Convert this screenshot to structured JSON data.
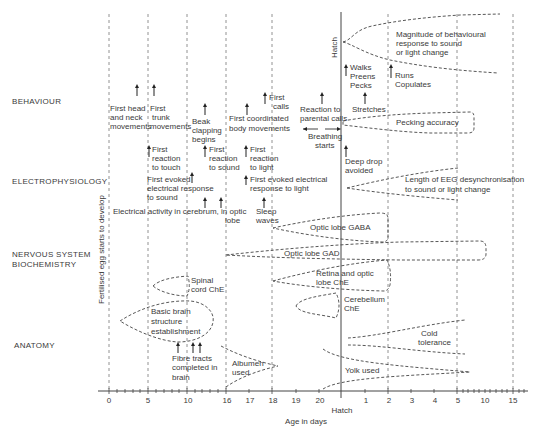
{
  "categories": {
    "behaviour": "BEHAVIOUR",
    "electrophysiology": "ELECTROPHYSIOLOGY",
    "nervous_system_1": "NERVOUS SYSTEM",
    "nervous_system_2": "BIOCHEMISTRY",
    "anatomy": "ANATOMY"
  },
  "vertical_note": "Fertilised egg starts to develop",
  "hatch_label_top": "Hatch",
  "axis": {
    "ticks": [
      "0",
      "5",
      "10",
      "16",
      "17",
      "18",
      "19",
      "20",
      "1",
      "2",
      "3",
      "4",
      "5",
      "10",
      "15"
    ],
    "hatch": "Hatch",
    "title": "Age in days"
  },
  "behaviour": {
    "head_neck": [
      "First head",
      "and neck",
      "movements"
    ],
    "trunk": [
      "First",
      "trunk",
      "movements"
    ],
    "beak": [
      "Beak",
      "clapping",
      "begins"
    ],
    "coordinated": [
      "First coordinated",
      "body movements"
    ],
    "calls": [
      "First",
      "calls"
    ],
    "parental": [
      "Reaction to",
      "parental calls"
    ],
    "breathing": [
      "Breathing",
      "starts"
    ],
    "walks": [
      "Walks",
      "Preens",
      "Pecks"
    ],
    "runs": [
      "Runs",
      "Copulates"
    ],
    "stretches": "Stretches",
    "pecking": "Pecking accuracy",
    "magnitude": [
      "Magnitude of behavioural",
      "response to sound",
      "or light change"
    ],
    "touch": [
      "First",
      "reaction",
      "to touch"
    ],
    "sound": [
      "First",
      "reaction",
      "to sound"
    ],
    "light": [
      "First",
      "reaction",
      "to light"
    ],
    "deep_drop": [
      "Deep drop",
      "avoided"
    ]
  },
  "electrophysiology": {
    "evoked_sound": [
      "First evoked",
      "electrical response",
      "to sound"
    ],
    "evoked_light": [
      "First evoked electrical",
      "response to light"
    ],
    "cerebrum": [
      "Electrical activity in cerebrum, in optic",
      "lobe"
    ],
    "sleep": [
      "Sleep",
      "waves"
    ],
    "eeg": [
      "Length of EEG desynchronisation",
      "to sound or light change"
    ]
  },
  "biochemistry": {
    "gaba": "Optic lobe GABA",
    "gad": "Optic lobe GAD",
    "retina": [
      "Retina and optic",
      "lobe ChE"
    ],
    "cerebellum": [
      "Cerebellum",
      "ChE"
    ],
    "spinal": [
      "Spinal",
      "cord ChE"
    ]
  },
  "anatomy": {
    "basic_brain": [
      "Basic brain",
      "structure",
      "establishment"
    ],
    "fibre": [
      "Fibre tracts",
      "completed in",
      "brain"
    ],
    "albumen": [
      "Albumen",
      "used"
    ],
    "yolk": "Yolk used",
    "cold": [
      "Cold",
      "tolerance"
    ]
  }
}
